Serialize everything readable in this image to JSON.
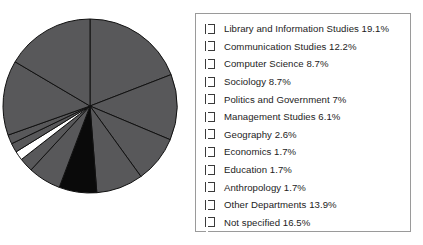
{
  "chart_data": {
    "type": "pie",
    "title": "",
    "subtitle": "",
    "xlabel": "",
    "ylabel": "",
    "grid": false,
    "legend_position": "right",
    "start_angle_deg": 0,
    "direction": "clockwise",
    "units": "percent",
    "categories": [
      "Library and Information Studies",
      "Communication Studies",
      "Computer Science",
      "Sociology",
      "Politics and Government",
      "Management Studies",
      "Geography",
      "Economics",
      "Education",
      "Anthropology",
      "Other Departments",
      "Not specified"
    ],
    "values": [
      19.1,
      12.2,
      8.7,
      8.7,
      7,
      6.1,
      2.6,
      1.7,
      1.7,
      1.7,
      13.9,
      16.5
    ],
    "value_labels": [
      "19.1%",
      "12.2%",
      "8.7%",
      "8.7%",
      "7%",
      "6.1%",
      "2.6%",
      "1.7%",
      "1.7%",
      "1.7%",
      "13.9%",
      "16.5%"
    ],
    "slice_colors": [
      "#58585a",
      "#58585a",
      "#58585a",
      "#58585a",
      "#0a0a0a",
      "#58585a",
      "#58585a",
      "#ffffff",
      "#58585a",
      "#58585a",
      "#58585a",
      "#58585a"
    ],
    "slice_edge_color": "#111111",
    "legend_entries": [
      {
        "label": "Library and Information Studies 19.1%",
        "color": "#58585a"
      },
      {
        "label": "Communication Studies 12.2%",
        "color": "#58585a"
      },
      {
        "label": "Computer Science 8.7%",
        "color": "#58585a"
      },
      {
        "label": "Sociology 8.7%",
        "color": "#58585a"
      },
      {
        "label": "Politics and Government 7%",
        "color": "#0a0a0a"
      },
      {
        "label": "Management Studies 6.1%",
        "color": "#58585a"
      },
      {
        "label": "Geography 2.6%",
        "color": "#58585a"
      },
      {
        "label": "Economics 1.7%",
        "color": "#ffffff"
      },
      {
        "label": "Education 1.7%",
        "color": "#58585a"
      },
      {
        "label": "Anthropology 1.7%",
        "color": "#58585a"
      },
      {
        "label": "Other Departments 13.9%",
        "color": "#58585a"
      },
      {
        "label": "Not specified 16.5%",
        "color": "#58585a"
      }
    ]
  },
  "legend": {
    "border_color": "#9a9a9a"
  },
  "pie": {
    "center_x": 90,
    "center_y": 106,
    "radius": 87
  }
}
